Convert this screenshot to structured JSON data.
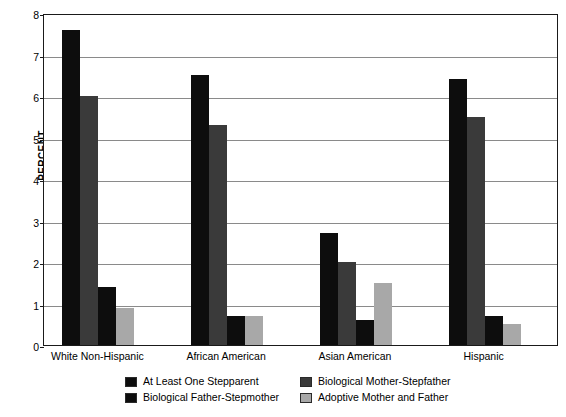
{
  "chart_data": {
    "type": "bar",
    "title": "",
    "xlabel": "",
    "ylabel": "PERCENT",
    "ylim": [
      0,
      8
    ],
    "ytick_labels": [
      "0",
      "1",
      "2",
      "3",
      "4",
      "5",
      "6",
      "7",
      "8"
    ],
    "ytick_values": [
      0,
      1,
      2,
      3,
      4,
      5,
      6,
      7,
      8
    ],
    "grid": true,
    "legend_position": "bottom",
    "categories": [
      "White Non-Hispanic",
      "African American",
      "Asian American",
      "Hispanic"
    ],
    "series": [
      {
        "name": "At Least One Stepparent",
        "color": "#0d0d0d",
        "values": [
          7.6,
          6.5,
          2.7,
          6.4
        ]
      },
      {
        "name": "Biological Mother-Stepfather",
        "color": "#3a3a3a",
        "values": [
          6.0,
          5.3,
          2.0,
          5.5
        ]
      },
      {
        "name": "Biological Father-Stepmother",
        "color": "#0d0d0d",
        "values": [
          1.4,
          0.7,
          0.6,
          0.7
        ]
      },
      {
        "name": "Adoptive Mother and Father",
        "color": "#a8a8a8",
        "values": [
          0.9,
          0.7,
          1.5,
          0.5
        ]
      }
    ]
  },
  "legend": {
    "entries": [
      {
        "label": "At Least One Stepparent",
        "color": "#0d0d0d"
      },
      {
        "label": "Biological Mother-Stepfather",
        "color": "#3a3a3a"
      },
      {
        "label": "Biological Father-Stepmother",
        "color": "#0d0d0d"
      },
      {
        "label": "Adoptive Mother and Father",
        "color": "#a8a8a8"
      }
    ]
  },
  "style": {
    "axis_color": "#1a1a1a",
    "gridline_color": "#8a8a8a",
    "background": "#ffffff"
  }
}
